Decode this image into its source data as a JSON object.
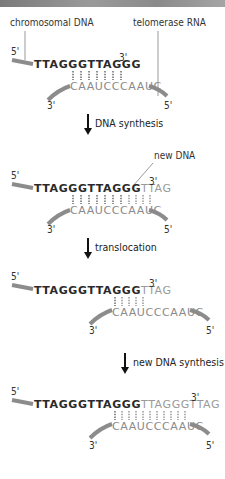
{
  "title_bar": {
    "visible": true
  },
  "labels": {
    "chromosomal_dna": "chromosomal DNA",
    "telomerase_rna": "telomerase RNA",
    "new_dna": "new DNA"
  },
  "steps": [
    {
      "label": "DNA synthesis"
    },
    {
      "label": "translocation"
    },
    {
      "label": "new DNA synthesis"
    }
  ],
  "ends": {
    "five": "5'",
    "three": "3'"
  },
  "panels": [
    {
      "dna_old": "TTAGGGTTAGGG",
      "dna_new": "",
      "rna": "CAAUCCCAAUC",
      "pairs": 7
    },
    {
      "dna_old": "TTAGGGTTAGGG",
      "dna_new": "TTAG",
      "rna": "CAAUCCCAAUC",
      "pairs": 11
    },
    {
      "dna_old": "TTAGGGTTAGGG",
      "dna_new": "TTAG",
      "rna": "CAAUCCCAAUC",
      "pairs": 5
    },
    {
      "dna_old": "TTAGGGTTAGGG",
      "dna_new": "TTAGGGTTAG",
      "rna": "CAAUCCCAAUC",
      "pairs": 11
    }
  ],
  "colors": {
    "strand": "#8c8c8c",
    "dna_old": "#2a2a2a",
    "dna_new": "#9a9a9a",
    "rna": "#8a8a8a",
    "hbond": "#555555"
  }
}
